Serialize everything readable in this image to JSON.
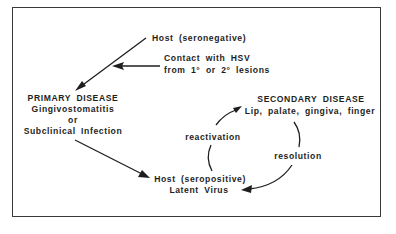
{
  "diagram": {
    "nodes": {
      "host_seronegative": {
        "label": "Host  (seronegative)"
      },
      "contact": {
        "line1": "Contact  with  HSV",
        "line2": "from 1°  or 2°  lesions"
      },
      "primary": {
        "title": "PRIMARY  DISEASE",
        "line1": "Gingivostomatitis",
        "line2": "or",
        "line3": "Subclinical  Infection"
      },
      "host_seropositive": {
        "line1": "Host  (seropositive)",
        "line2": "Latent  Virus"
      },
      "secondary": {
        "title": "SECONDARY  DISEASE",
        "line1": "Lip,  palate,  gingiva,  finger"
      }
    },
    "edge_labels": {
      "reactivation": "reactivation",
      "resolution": "resolution"
    },
    "edges": [
      {
        "from": "host_seronegative",
        "to": "primary",
        "type": "arrow"
      },
      {
        "from": "contact",
        "to": "host_seronegative->primary",
        "type": "arrow"
      },
      {
        "from": "primary",
        "to": "host_seropositive",
        "type": "arrow"
      },
      {
        "from": "host_seropositive",
        "to": "secondary",
        "label": "reactivation",
        "type": "curved-arrow"
      },
      {
        "from": "secondary",
        "to": "host_seropositive",
        "label": "resolution",
        "type": "curved-arrow"
      }
    ],
    "colors": {
      "ink": "#1e1e1e",
      "frame": "#3a3a3a",
      "background": "#ffffff"
    }
  }
}
